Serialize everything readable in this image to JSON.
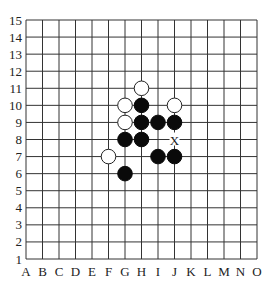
{
  "board": {
    "size": 15,
    "columns": [
      "A",
      "B",
      "C",
      "D",
      "E",
      "F",
      "G",
      "H",
      "I",
      "J",
      "K",
      "L",
      "M",
      "N",
      "O"
    ],
    "rows": [
      "1",
      "2",
      "3",
      "4",
      "5",
      "6",
      "7",
      "8",
      "9",
      "10",
      "11",
      "12",
      "13",
      "14",
      "15"
    ],
    "stones": [
      {
        "color": "white",
        "col": "H",
        "row": 11
      },
      {
        "color": "white",
        "col": "G",
        "row": 10
      },
      {
        "color": "white",
        "col": "J",
        "row": 10
      },
      {
        "color": "white",
        "col": "G",
        "row": 9
      },
      {
        "color": "white",
        "col": "F",
        "row": 7
      },
      {
        "color": "black",
        "col": "H",
        "row": 10
      },
      {
        "color": "black",
        "col": "H",
        "row": 9
      },
      {
        "color": "black",
        "col": "I",
        "row": 9
      },
      {
        "color": "black",
        "col": "J",
        "row": 9
      },
      {
        "color": "black",
        "col": "G",
        "row": 8
      },
      {
        "color": "black",
        "col": "H",
        "row": 8
      },
      {
        "color": "black",
        "col": "I",
        "row": 7
      },
      {
        "color": "black",
        "col": "J",
        "row": 7
      },
      {
        "color": "black",
        "col": "G",
        "row": 6
      }
    ],
    "markers": [
      {
        "label": "X",
        "col": "J",
        "row": 8
      }
    ],
    "colors": {
      "line": "#333333",
      "black": "#0a0a0a",
      "white": "#ffffff",
      "background": "#ffffff"
    }
  }
}
